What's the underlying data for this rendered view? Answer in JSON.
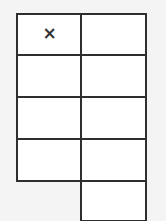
{
  "grid": {
    "left": [
      {
        "mark": "×"
      },
      {
        "mark": ""
      },
      {
        "mark": ""
      },
      {
        "mark": ""
      }
    ],
    "right": [
      {
        "mark": ""
      },
      {
        "mark": ""
      },
      {
        "mark": ""
      },
      {
        "mark": ""
      },
      {
        "mark": ""
      }
    ]
  },
  "colors": {
    "line": "#2e2e2e",
    "background": "#f4f4f4",
    "cell": "#ffffff"
  }
}
